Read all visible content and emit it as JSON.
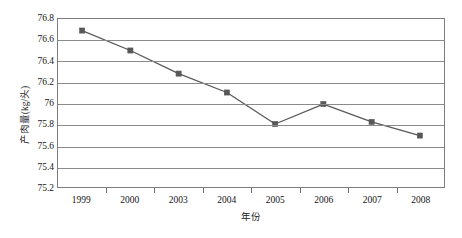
{
  "chart_data": {
    "type": "line",
    "title": "",
    "subtitle": "",
    "xlabel": "年份",
    "ylabel": "产肉量(kg/头)",
    "categories": [
      "1999",
      "2000",
      "2003",
      "2004",
      "2005",
      "2006",
      "2007",
      "2008"
    ],
    "values": [
      76.69,
      76.5,
      76.28,
      76.1,
      75.8,
      75.99,
      75.82,
      75.69
    ],
    "series": [
      {
        "name": "产肉量",
        "values": [
          76.69,
          76.5,
          76.28,
          76.1,
          75.8,
          75.99,
          75.82,
          75.69
        ]
      }
    ],
    "ylim": [
      75.2,
      76.8
    ],
    "ytick_labels": [
      "76.8",
      "76.6",
      "76.4",
      "76.2",
      "76",
      "75.8",
      "75.6",
      "75.4",
      "75.2"
    ],
    "ytick_values": [
      76.8,
      76.6,
      76.4,
      76.2,
      76.0,
      75.8,
      75.6,
      75.4,
      75.2
    ],
    "grid": true,
    "legend": false,
    "legend_position": "none",
    "line_color": "#59595b",
    "marker_color": "#585858",
    "marker_shape": "square",
    "gridline_color": "#8a8a8a",
    "border_color": "#7d7d7d",
    "background_color": "#ffffff"
  }
}
